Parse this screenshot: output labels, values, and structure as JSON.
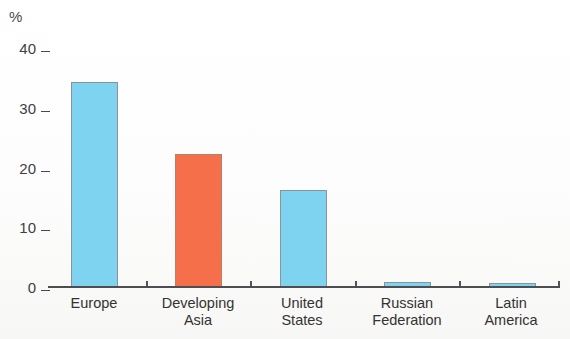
{
  "chart_data": {
    "type": "bar",
    "title": "",
    "subtitle": "",
    "xlabel": "",
    "ylabel": "%",
    "unit_label": "%",
    "categories": [
      "Europe",
      "Developing Asia",
      "United States",
      "Russian Federation",
      "Latin America"
    ],
    "category_lines": [
      [
        "Europe"
      ],
      [
        "Developing",
        "Asia"
      ],
      [
        "United",
        "States"
      ],
      [
        "Russian",
        "Federation"
      ],
      [
        "Latin",
        "America"
      ]
    ],
    "values": [
      34.3,
      22.2,
      16.2,
      0.8,
      0.7
    ],
    "bar_colors": [
      "#7dd3f0",
      "#f5704a",
      "#7dd3f0",
      "#7dd3f0",
      "#7dd3f0"
    ],
    "ylim": [
      0,
      40
    ],
    "yticks": [
      0,
      10,
      20,
      30,
      40
    ],
    "ytick_labels": [
      "0",
      "10",
      "20",
      "30",
      "40"
    ],
    "grid": false,
    "legend": null,
    "annotations": []
  },
  "axis": {
    "unit": "%",
    "tick_0": "0",
    "tick_10": "10",
    "tick_20": "20",
    "tick_30": "30",
    "tick_40": "40"
  },
  "labels": {
    "c0_l1": "Europe",
    "c0_l2": "",
    "c1_l1": "Developing",
    "c1_l2": "Asia",
    "c2_l1": "United",
    "c2_l2": "States",
    "c3_l1": "Russian",
    "c3_l2": "Federation",
    "c4_l1": "Latin",
    "c4_l2": "America"
  },
  "colors": {
    "bar_blue": "#7dd3f0",
    "bar_orange": "#f5704a",
    "axis": "#4d4d52",
    "text": "#333333",
    "background": "#ffffff"
  }
}
